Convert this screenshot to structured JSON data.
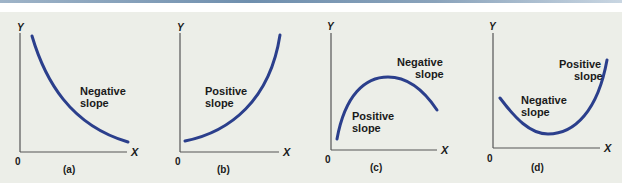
{
  "colors": {
    "curve": "#2b3f8c",
    "axis": "#555555",
    "background": "#eceee8",
    "top_rule": "#7a97b3"
  },
  "panels": [
    {
      "id": "a",
      "caption": "(a)",
      "y_label": "Y",
      "x_label": "X",
      "origin": "0",
      "annotations": [
        {
          "line1": "Negative",
          "line2": "slope"
        }
      ],
      "shape": "decreasing convex"
    },
    {
      "id": "b",
      "caption": "(b)",
      "y_label": "Y",
      "x_label": "X",
      "origin": "0",
      "annotations": [
        {
          "line1": "Positive",
          "line2": "slope"
        }
      ],
      "shape": "increasing convex"
    },
    {
      "id": "c",
      "caption": "(c)",
      "y_label": "Y",
      "x_label": "X",
      "origin": "0",
      "annotations": [
        {
          "line1": "Negative",
          "line2": "slope"
        },
        {
          "line1": "Positive",
          "line2": "slope"
        }
      ],
      "shape": "inverted U (maximum)"
    },
    {
      "id": "d",
      "caption": "(d)",
      "y_label": "Y",
      "x_label": "X",
      "origin": "0",
      "annotations": [
        {
          "line1": "Positive",
          "line2": "slope"
        },
        {
          "line1": "Negative",
          "line2": "slope"
        }
      ],
      "shape": "U (minimum)"
    }
  ]
}
